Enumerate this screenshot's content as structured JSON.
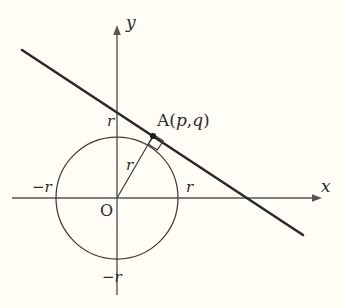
{
  "figure": {
    "kind": "geometry-diagram",
    "background_color": "#fffdf6",
    "stroke_color": "#3a3a3a",
    "axis_color": "#555555",
    "labels": {
      "x_axis": "x",
      "y_axis": "y",
      "origin": "O",
      "radius_segment": "r",
      "y_intercept_top": "r",
      "y_intercept_bottom": "−r",
      "x_intercept_right": "r",
      "x_intercept_left": "−r",
      "point_a_prefix": "A(",
      "point_a_p": "p",
      "point_a_comma": ",",
      "point_a_q": "q",
      "point_a_suffix": ")"
    },
    "geometry": {
      "circle": {
        "cx": 117,
        "cy": 198,
        "r": 61
      },
      "point_a": {
        "x": 153,
        "y": 136
      },
      "tangent_line": {
        "x1": 22,
        "y1": 50,
        "x2": 303,
        "y2": 235
      },
      "radius_line": {
        "x1": 117,
        "y1": 198,
        "x2": 153,
        "y2": 136
      },
      "x_axis": {
        "x1": 12,
        "y1": 198,
        "x2": 322,
        "y2": 198
      },
      "y_axis": {
        "x1": 117,
        "y1": 295,
        "x2": 117,
        "y2": 25
      },
      "right_angle_marker": true
    }
  }
}
